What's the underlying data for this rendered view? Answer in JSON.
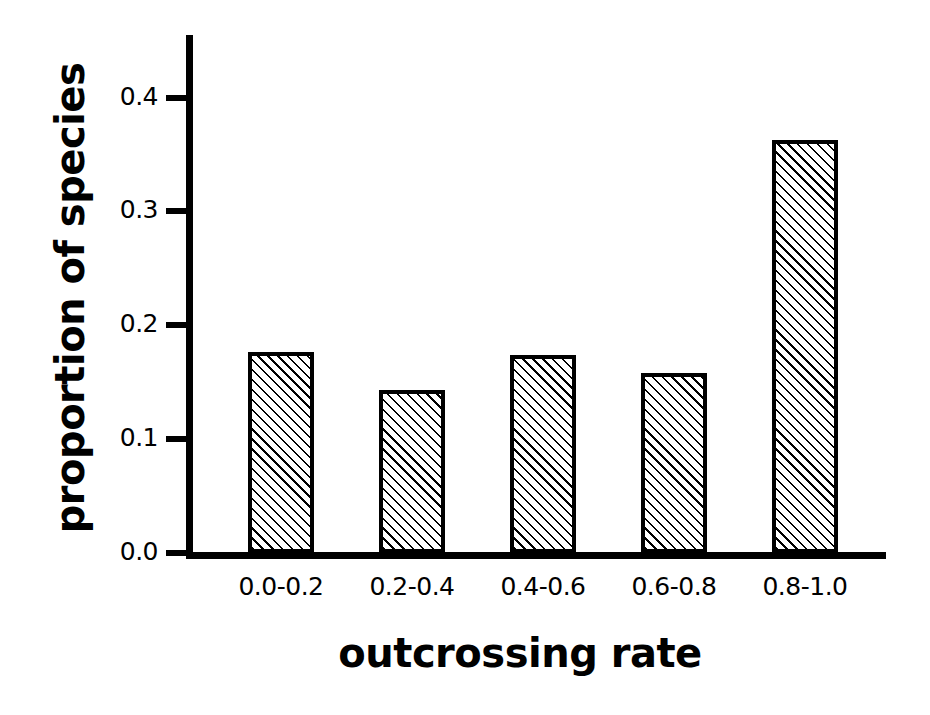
{
  "chart_data": {
    "type": "bar",
    "title": "",
    "xlabel": "outcrossing rate",
    "ylabel": "proportion of species",
    "categories": [
      "0.0-0.2",
      "0.2-0.4",
      "0.4-0.6",
      "0.6-0.8",
      "0.8-1.0"
    ],
    "values": [
      0.177,
      0.143,
      0.174,
      0.158,
      0.363
    ],
    "yticks": [
      "0.0",
      "0.1",
      "0.2",
      "0.3",
      "0.4"
    ],
    "ytick_values": [
      0.0,
      0.1,
      0.2,
      0.3,
      0.4
    ],
    "ylim": [
      0.0,
      0.46
    ],
    "grid": false,
    "legend": null,
    "bar_fill": "diagonal-hatch",
    "bar_edge_color": "#000000",
    "bar_face_color": "#ffffff",
    "axis_color": "#000000",
    "background_color": "#ffffff"
  },
  "axes": {
    "y_title": "proportion of species",
    "x_title": "outcrossing rate"
  }
}
